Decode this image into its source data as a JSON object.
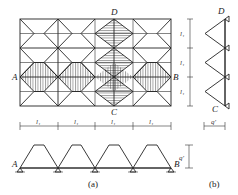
{
  "figure": {
    "panel_a": {
      "caption": "(a)",
      "grid": {
        "columns": 4,
        "rows": 3
      },
      "point_labels": {
        "A": "A",
        "B": "B",
        "C": "C",
        "D": "D"
      },
      "span_labels": [
        "l₁",
        "l₁",
        "l₁",
        "l₁"
      ],
      "row_labels": [
        "l₁",
        "l₁",
        "l₁"
      ],
      "load_label": "q′",
      "beam_label_left": "A",
      "beam_label_right": "B"
    },
    "panel_b": {
      "caption": "(b)",
      "top_label": "D",
      "bottom_label": "C",
      "load_label": "q′"
    },
    "colors": {
      "line": "#222222",
      "background": "#ffffff"
    }
  }
}
